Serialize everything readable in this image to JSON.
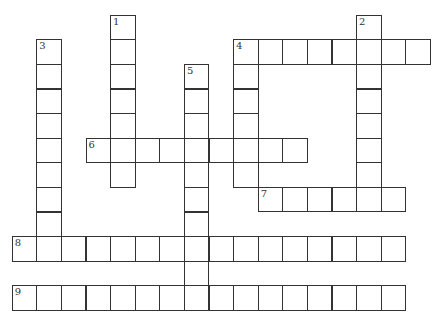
{
  "puzzle": {
    "type": "crossword",
    "grid": {
      "origin_x": 12.5,
      "origin_y": 15.5,
      "cell_size": 24.6
    },
    "entries": [
      {
        "number": "1",
        "direction": "down",
        "row": 0,
        "col": 4,
        "length": 7
      },
      {
        "number": "2",
        "direction": "down",
        "row": 0,
        "col": 14,
        "length": 8
      },
      {
        "number": "3",
        "direction": "down",
        "row": 1,
        "col": 1,
        "length": 9
      },
      {
        "number": "4",
        "direction": "across",
        "row": 1,
        "col": 9,
        "length": 8
      },
      {
        "number": "4",
        "direction": "down",
        "row": 1,
        "col": 9,
        "length": 6
      },
      {
        "number": "5",
        "direction": "down",
        "row": 2,
        "col": 7,
        "length": 10
      },
      {
        "number": "6",
        "direction": "across",
        "row": 5,
        "col": 3,
        "length": 9
      },
      {
        "number": "7",
        "direction": "across",
        "row": 7,
        "col": 10,
        "length": 6
      },
      {
        "number": "8",
        "direction": "across",
        "row": 9,
        "col": 0,
        "length": 16
      },
      {
        "number": "9",
        "direction": "across",
        "row": 11,
        "col": 0,
        "length": 16
      }
    ]
  }
}
